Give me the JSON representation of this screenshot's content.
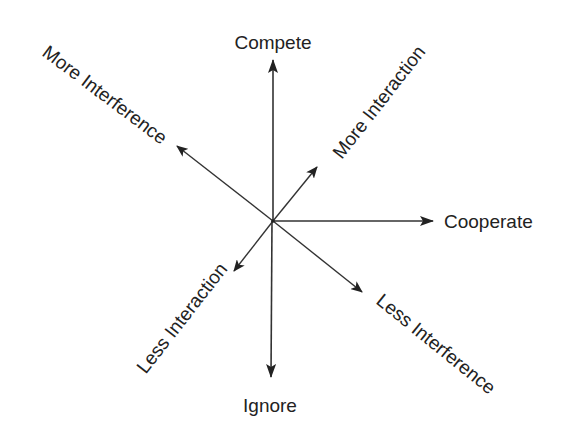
{
  "diagram": {
    "type": "radial-axes",
    "center": {
      "x": 273,
      "y": 221
    },
    "colors": {
      "line": "#333333",
      "text": "#222222",
      "background": "#ffffff"
    },
    "axes": [
      {
        "id": "compete",
        "label": "Compete",
        "direction": "up"
      },
      {
        "id": "ignore",
        "label": "Ignore",
        "direction": "down"
      },
      {
        "id": "cooperate",
        "label": "Cooperate",
        "direction": "right"
      },
      {
        "id": "more-interference",
        "label": "More Interference",
        "direction": "up-left"
      },
      {
        "id": "more-interaction",
        "label": "More Interaction",
        "direction": "up-right"
      },
      {
        "id": "less-interaction",
        "label": "Less Interaction",
        "direction": "down-left"
      },
      {
        "id": "less-interference",
        "label": "Less Interference",
        "direction": "down-right"
      }
    ]
  }
}
